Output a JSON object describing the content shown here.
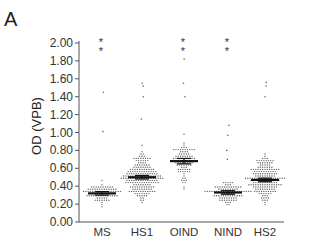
{
  "panel_label": "A",
  "chart_data": {
    "type": "scatter",
    "subtype": "dot-plot with mean ± SEM",
    "title": "",
    "panel": "A",
    "xlabel": "",
    "ylabel": "OD (VPB)",
    "ylim": [
      0.0,
      2.0
    ],
    "yticks": [
      "0.00",
      "0.20",
      "0.40",
      "0.60",
      "0.80",
      "1.00",
      "1.20",
      "1.40",
      "1.60",
      "1.80",
      "2.00"
    ],
    "categories": [
      "MS",
      "HS1",
      "OIND",
      "NIND",
      "HS2"
    ],
    "series": [
      {
        "name": "MS",
        "mean": 0.32,
        "sem": 0.02,
        "n": 80,
        "spread": [
          0.1,
          0.55
        ],
        "outliers": [
          1.45,
          1.01
        ],
        "significance": "**"
      },
      {
        "name": "HS1",
        "mean": 0.5,
        "sem": 0.02,
        "n": 200,
        "spread": [
          0.06,
          1.0
        ],
        "outliers": [
          1.55,
          1.52,
          1.4,
          1.15
        ],
        "significance": ""
      },
      {
        "name": "OIND",
        "mean": 0.68,
        "sem": 0.03,
        "n": 90,
        "spread": [
          0.22,
          1.08
        ],
        "outliers": [
          1.82,
          1.55,
          1.4
        ],
        "significance": "**"
      },
      {
        "name": "NIND",
        "mean": 0.33,
        "sem": 0.02,
        "n": 90,
        "spread": [
          0.16,
          0.6
        ],
        "outliers": [
          1.08,
          0.97,
          0.8,
          0.7
        ],
        "significance": "**"
      },
      {
        "name": "HS2",
        "mean": 0.47,
        "sem": 0.02,
        "n": 180,
        "spread": [
          0.07,
          0.98
        ],
        "outliers": [
          1.56,
          1.52,
          1.4
        ],
        "significance": ""
      }
    ],
    "grid": false,
    "legend": null,
    "annotations": [
      "** above MS",
      "** above OIND",
      "** above NIND"
    ]
  }
}
